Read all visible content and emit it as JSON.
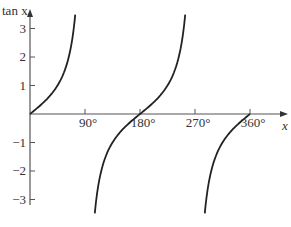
{
  "chart_data": {
    "type": "line",
    "title": "",
    "function": "tan x",
    "xlabel": "x",
    "ylabel": "tan x",
    "x_ticks": [
      90,
      180,
      270,
      360
    ],
    "x_tick_labels": [
      "90°",
      "180°",
      "270°",
      "360°"
    ],
    "y_ticks": [
      -3,
      -2,
      -1,
      1,
      2,
      3
    ],
    "y_tick_labels": [
      "−3",
      "−2",
      "−1",
      "1",
      "2",
      "3"
    ],
    "xlim": [
      0,
      370
    ],
    "ylim": [
      -3.6,
      3.6
    ],
    "grid": false,
    "legend": null,
    "asymptotes": [
      90,
      270
    ],
    "series": [
      {
        "name": "tan x (0° to 90°)",
        "x": [
          0,
          30,
          45,
          60,
          70,
          74
        ],
        "y": [
          0,
          0.58,
          1.0,
          1.73,
          2.75,
          3.49
        ]
      },
      {
        "name": "tan x (90° to 270°)",
        "x": [
          106,
          120,
          135,
          150,
          180,
          210,
          225,
          240,
          254
        ],
        "y": [
          -3.49,
          -1.73,
          -1.0,
          -0.58,
          0,
          0.58,
          1.0,
          1.73,
          3.49
        ]
      },
      {
        "name": "tan x (270° to 360°)",
        "x": [
          286,
          300,
          315,
          330,
          360
        ],
        "y": [
          -3.49,
          -1.73,
          -1.0,
          -0.58,
          0
        ]
      }
    ]
  }
}
